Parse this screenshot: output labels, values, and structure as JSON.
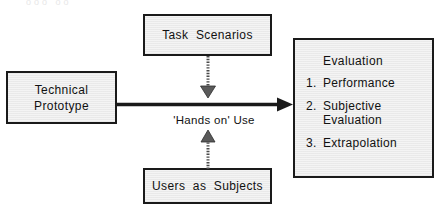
{
  "diagram": {
    "type": "flow-diagram",
    "colors": {
      "box_fill": "#f4f4f4",
      "box_border": "#1a1a1a",
      "text": "#111111",
      "connector": "#1a1a1a",
      "page_background": "#ffffff"
    },
    "scan_artifact_text": "ooo oo"
  },
  "nodes": {
    "task_scenarios": {
      "label": "Task  Scenarios",
      "position": "top-center"
    },
    "technical_prototype": {
      "label": "Technical\nPrototype",
      "position": "left"
    },
    "users_as_subjects": {
      "label": "Users  as  Subjects",
      "position": "bottom-center"
    },
    "evaluation": {
      "heading": "Evaluation",
      "items": [
        {
          "number": "1.",
          "text": "Performance"
        },
        {
          "number": "2.",
          "text": "Subjective\nEvaluation"
        },
        {
          "number": "3.",
          "text": "Extrapolation"
        }
      ],
      "position": "right"
    }
  },
  "connectors": {
    "prototype_to_evaluation": {
      "style": "solid-arrow",
      "direction": "right",
      "label": "'Hands on' Use",
      "from": "technical_prototype",
      "to": "evaluation"
    },
    "task_scenarios_to_link": {
      "style": "dotted-arrow",
      "direction": "down",
      "from": "task_scenarios",
      "to": "prototype_to_evaluation"
    },
    "users_to_link": {
      "style": "dotted-arrow",
      "direction": "up",
      "from": "users_as_subjects",
      "to": "prototype_to_evaluation"
    }
  }
}
